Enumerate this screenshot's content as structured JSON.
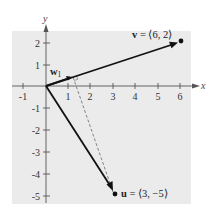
{
  "diagram": {
    "type": "vector-projection",
    "axes": {
      "x_label": "x",
      "y_label": "y",
      "x_ticks": [
        "-1",
        "1",
        "2",
        "3",
        "4",
        "5",
        "6"
      ],
      "y_ticks": [
        "2",
        "1",
        "-1",
        "-2",
        "-3",
        "-4",
        "-5"
      ],
      "x_range": [
        -1,
        6
      ],
      "y_range": [
        -5,
        2
      ]
    },
    "vectors": {
      "v": {
        "name": "v",
        "label_rest": " = ⟨6, 2⟩",
        "x": 6,
        "y": 2
      },
      "u": {
        "name": "u",
        "label_rest": " = ⟨3, −5⟩",
        "x": 3,
        "y": -5
      },
      "w1": {
        "name": "w",
        "subscript": "1",
        "x": 1.2,
        "y": 0.4
      }
    },
    "colors": {
      "background_panel": "#ebebeb",
      "vector": "#111111",
      "dashed": "#777777",
      "axis": "#555555"
    }
  }
}
